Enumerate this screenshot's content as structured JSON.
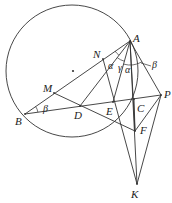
{
  "diagram": {
    "stroke_color": "#333333",
    "circle": {
      "cx": 72,
      "cy": 71,
      "r": 66
    },
    "center_dot": {
      "x": 73,
      "y": 71
    },
    "points": {
      "A": {
        "x": 130,
        "y": 41,
        "label": "A",
        "lx": 133,
        "ly": 42
      },
      "B": {
        "x": 25,
        "y": 114,
        "label": "B",
        "lx": 15,
        "ly": 125
      },
      "M": {
        "x": 54,
        "y": 93,
        "label": "M",
        "lx": 43,
        "ly": 92
      },
      "N": {
        "x": 103,
        "y": 59,
        "label": "N",
        "lx": 93,
        "ly": 58
      },
      "D": {
        "x": 80,
        "y": 106,
        "label": "D",
        "lx": 74,
        "ly": 119
      },
      "E": {
        "x": 113,
        "y": 102,
        "label": "E",
        "lx": 106,
        "ly": 115
      },
      "C": {
        "x": 134,
        "y": 99,
        "label": "C",
        "lx": 137,
        "ly": 112
      },
      "P": {
        "x": 161,
        "y": 95,
        "label": "P",
        "lx": 164,
        "ly": 98
      },
      "F": {
        "x": 135,
        "y": 131,
        "label": "F",
        "lx": 140,
        "ly": 134
      },
      "K": {
        "x": 137,
        "y": 184,
        "label": "K",
        "lx": 131,
        "ly": 198
      }
    },
    "segments": [
      [
        "A",
        "B"
      ],
      [
        "B",
        "P"
      ],
      [
        "A",
        "P"
      ],
      [
        "A",
        "K"
      ],
      [
        "A",
        "D"
      ],
      [
        "A",
        "E"
      ],
      [
        "N",
        "K"
      ],
      [
        "P",
        "K"
      ],
      [
        "M",
        "F"
      ],
      [
        "C",
        "F"
      ],
      [
        "P",
        "F"
      ],
      [
        "A",
        "F"
      ]
    ],
    "angle_labels": [
      {
        "text": "α",
        "x": 108,
        "y": 69
      },
      {
        "text": "γ",
        "x": 118,
        "y": 71
      },
      {
        "text": "α",
        "x": 125,
        "y": 73
      },
      {
        "text": "β",
        "x": 152,
        "y": 68
      },
      {
        "text": "β",
        "x": 43,
        "y": 112
      }
    ]
  }
}
